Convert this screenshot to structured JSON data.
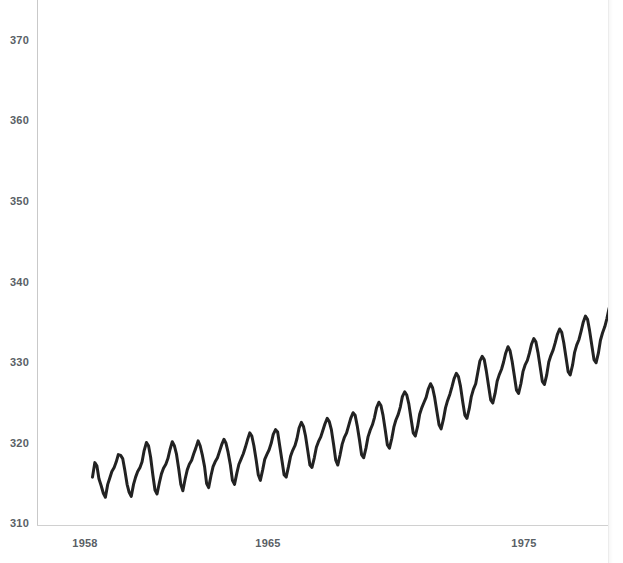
{
  "chart_data": {
    "type": "line",
    "title": "",
    "subtitle": "",
    "xlabel": "",
    "ylabel": "",
    "xlim": [
      1958.2,
      1978.6
    ],
    "ylim": [
      310,
      373.6
    ],
    "grid": false,
    "legend": null,
    "annotations": [],
    "line_color": "#222222",
    "line_width": 3,
    "x_tick_labels": [
      "1958",
      "1965",
      "1975"
    ],
    "x_tick_values": [
      1958,
      1965,
      1975
    ],
    "y_tick_labels": [
      "310",
      "320",
      "330",
      "340",
      "350",
      "360",
      "370"
    ],
    "y_tick_values": [
      310,
      320,
      330,
      340,
      350,
      360,
      370
    ],
    "series": [
      {
        "name": "Atmospheric CO2 (ppm)",
        "x": [
          1958.29,
          1958.38,
          1958.46,
          1958.54,
          1958.63,
          1958.71,
          1958.79,
          1958.88,
          1958.96,
          1959.04,
          1959.13,
          1959.21,
          1959.29,
          1959.38,
          1959.46,
          1959.54,
          1959.63,
          1959.71,
          1959.79,
          1959.88,
          1959.96,
          1960.04,
          1960.13,
          1960.21,
          1960.29,
          1960.38,
          1960.46,
          1960.54,
          1960.63,
          1960.71,
          1960.79,
          1960.88,
          1960.96,
          1961.04,
          1961.13,
          1961.21,
          1961.29,
          1961.38,
          1961.46,
          1961.54,
          1961.63,
          1961.71,
          1961.79,
          1961.88,
          1961.96,
          1962.04,
          1962.13,
          1962.21,
          1962.29,
          1962.38,
          1962.46,
          1962.54,
          1962.63,
          1962.71,
          1962.79,
          1962.88,
          1962.96,
          1963.04,
          1963.13,
          1963.21,
          1963.29,
          1963.38,
          1963.46,
          1963.54,
          1963.63,
          1963.71,
          1963.79,
          1963.88,
          1963.96,
          1964.04,
          1964.13,
          1964.21,
          1964.29,
          1964.38,
          1964.46,
          1964.54,
          1964.63,
          1964.71,
          1964.79,
          1964.88,
          1964.96,
          1965.04,
          1965.13,
          1965.21,
          1965.29,
          1965.38,
          1965.46,
          1965.54,
          1965.63,
          1965.71,
          1965.79,
          1965.88,
          1965.96,
          1966.04,
          1966.13,
          1966.21,
          1966.29,
          1966.38,
          1966.46,
          1966.54,
          1966.63,
          1966.71,
          1966.79,
          1966.88,
          1966.96,
          1967.04,
          1967.13,
          1967.21,
          1967.29,
          1967.38,
          1967.46,
          1967.54,
          1967.63,
          1967.71,
          1967.79,
          1967.88,
          1967.96,
          1968.04,
          1968.13,
          1968.21,
          1968.29,
          1968.38,
          1968.46,
          1968.54,
          1968.63,
          1968.71,
          1968.79,
          1968.88,
          1968.96,
          1969.04,
          1969.13,
          1969.21,
          1969.29,
          1969.38,
          1969.46,
          1969.54,
          1969.63,
          1969.71,
          1969.79,
          1969.88,
          1969.96,
          1970.04,
          1970.13,
          1970.21,
          1970.29,
          1970.38,
          1970.46,
          1970.54,
          1970.63,
          1970.71,
          1970.79,
          1970.88,
          1970.96,
          1971.04,
          1971.13,
          1971.21,
          1971.29,
          1971.38,
          1971.46,
          1971.54,
          1971.63,
          1971.71,
          1971.79,
          1971.88,
          1971.96,
          1972.04,
          1972.13,
          1972.21,
          1972.29,
          1972.38,
          1972.46,
          1972.54,
          1972.63,
          1972.71,
          1972.79,
          1972.88,
          1972.96,
          1973.04,
          1973.13,
          1973.21,
          1973.29,
          1973.38,
          1973.46,
          1973.54,
          1973.63,
          1973.71,
          1973.79,
          1973.88,
          1973.96,
          1974.04,
          1974.13,
          1974.21,
          1974.29,
          1974.38,
          1974.46,
          1974.54,
          1974.63,
          1974.71,
          1974.79,
          1974.88,
          1974.96,
          1975.04,
          1975.13,
          1975.21,
          1975.29,
          1975.38,
          1975.46,
          1975.54,
          1975.63,
          1975.71,
          1975.79,
          1975.88,
          1975.96,
          1976.04,
          1976.13,
          1976.21,
          1976.29,
          1976.38,
          1976.46,
          1976.54,
          1976.63,
          1976.71,
          1976.79,
          1976.88,
          1976.96,
          1977.04,
          1977.13,
          1977.21,
          1977.29,
          1977.38,
          1977.46,
          1977.54,
          1977.63,
          1977.71,
          1977.79,
          1977.88,
          1977.96,
          1978.04,
          1978.13,
          1978.21,
          1978.29,
          1978.38,
          1978.46
        ],
        "y": [
          315.7,
          317.5,
          317.1,
          315.5,
          314.6,
          313.7,
          313.2,
          314.8,
          315.6,
          316.4,
          316.9,
          317.6,
          318.5,
          318.4,
          318.0,
          316.6,
          314.8,
          313.8,
          313.3,
          314.8,
          315.7,
          316.4,
          316.9,
          317.6,
          319.0,
          320.0,
          319.6,
          318.2,
          315.9,
          314.1,
          313.6,
          315.0,
          316.1,
          316.8,
          317.3,
          318.0,
          319.1,
          320.1,
          319.6,
          318.6,
          316.7,
          314.8,
          314.0,
          315.5,
          316.6,
          317.3,
          317.8,
          318.6,
          319.3,
          320.2,
          319.6,
          318.5,
          317.0,
          314.9,
          314.4,
          315.9,
          317.0,
          317.6,
          318.1,
          318.9,
          319.7,
          320.4,
          319.9,
          318.8,
          317.2,
          315.3,
          314.8,
          316.2,
          317.3,
          317.9,
          318.6,
          319.4,
          320.3,
          321.2,
          320.8,
          319.6,
          317.8,
          316.0,
          315.3,
          316.6,
          317.9,
          318.5,
          319.1,
          319.9,
          321.0,
          321.6,
          321.3,
          319.6,
          317.7,
          316.0,
          315.7,
          317.0,
          318.3,
          319.0,
          319.6,
          320.5,
          321.8,
          322.5,
          322.0,
          320.8,
          318.9,
          317.2,
          316.9,
          318.1,
          319.4,
          320.1,
          320.7,
          321.5,
          322.3,
          323.0,
          322.6,
          321.6,
          319.7,
          317.8,
          317.2,
          318.5,
          319.8,
          320.6,
          321.2,
          322.1,
          323.0,
          323.7,
          323.4,
          322.1,
          320.3,
          318.5,
          318.1,
          319.3,
          320.7,
          321.5,
          322.2,
          323.1,
          324.3,
          325.0,
          324.6,
          323.4,
          321.5,
          319.7,
          319.3,
          320.5,
          321.9,
          322.8,
          323.5,
          324.4,
          325.7,
          326.3,
          325.9,
          324.8,
          322.9,
          321.2,
          320.8,
          322.0,
          323.5,
          324.3,
          325.0,
          325.6,
          326.6,
          327.3,
          326.8,
          325.6,
          323.8,
          322.2,
          321.7,
          322.9,
          324.3,
          325.2,
          326.0,
          326.9,
          327.9,
          328.6,
          328.2,
          327.0,
          325.0,
          323.4,
          323.0,
          324.2,
          325.7,
          326.6,
          327.3,
          328.7,
          330.1,
          330.7,
          330.3,
          328.9,
          327.0,
          325.3,
          324.9,
          326.1,
          327.6,
          328.4,
          329.1,
          330.0,
          331.1,
          331.9,
          331.4,
          330.1,
          328.2,
          326.5,
          326.1,
          327.3,
          328.8,
          329.6,
          330.2,
          331.1,
          332.2,
          332.9,
          332.5,
          331.2,
          329.3,
          327.6,
          327.2,
          328.4,
          330.0,
          330.8,
          331.5,
          332.4,
          333.4,
          334.1,
          333.7,
          332.4,
          330.5,
          328.8,
          328.4,
          329.6,
          331.2,
          332.1,
          332.8,
          333.8,
          334.9,
          335.7,
          335.3,
          333.9,
          332.0,
          330.3,
          329.9,
          331.1,
          332.7,
          333.6,
          334.4,
          335.4,
          336.6,
          337.6,
          338.1
        ]
      }
    ]
  },
  "axes": {
    "y_ticks": [
      {
        "label": "370",
        "value": 370
      },
      {
        "label": "360",
        "value": 360
      },
      {
        "label": "350",
        "value": 350
      },
      {
        "label": "340",
        "value": 340
      },
      {
        "label": "330",
        "value": 330
      },
      {
        "label": "320",
        "value": 320
      },
      {
        "label": "310",
        "value": 310
      }
    ],
    "x_ticks": [
      {
        "label": "1958",
        "value": 1958
      },
      {
        "label": "1965",
        "value": 1965
      },
      {
        "label": "1975",
        "value": 1975
      }
    ],
    "tick_color": "#5a5f66",
    "axis_line_color": "#c9c9c9"
  },
  "geometry": {
    "plot_left": 37,
    "plot_right": 608,
    "plot_top": 0,
    "plot_bottom": 525,
    "x_1958_px": 85,
    "x_1965_px": 268,
    "x_1975_px": 524,
    "y_310_px": 523,
    "y_370_px": 40
  }
}
